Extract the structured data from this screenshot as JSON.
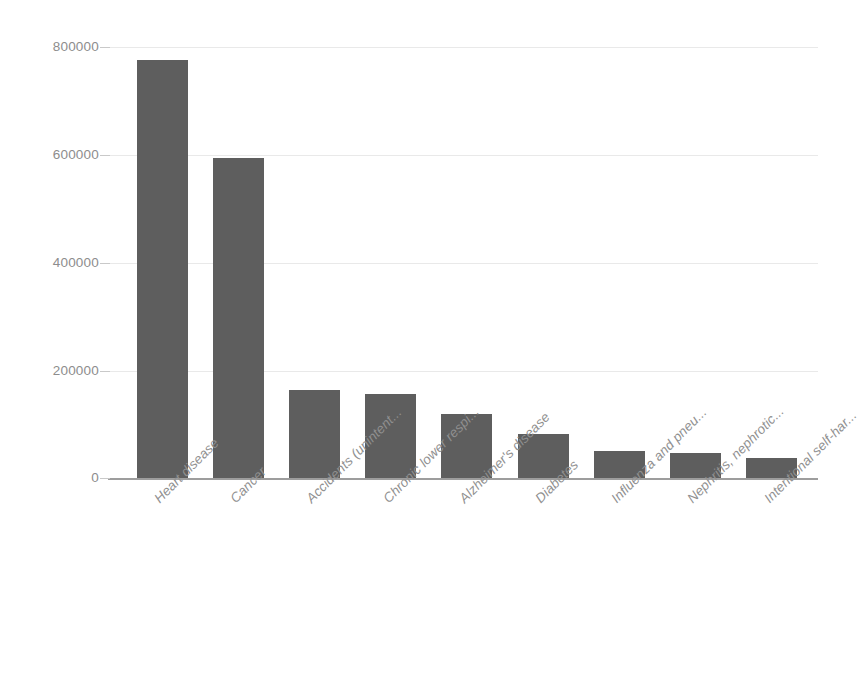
{
  "chart_data": {
    "type": "bar",
    "title": "",
    "subtitle": "",
    "xlabel": "",
    "ylabel": "",
    "ylim": [
      0,
      800000
    ],
    "grid": true,
    "legend": false,
    "legend_position": "none",
    "orientation": "vertical",
    "categories": [
      "Heart disease",
      "Cancer",
      "Accidents (unintent...",
      "Chronic lower respi...",
      "Alzheimer's disease",
      "Diabetes",
      "Influenza and pneu...",
      "Nephritis, nephrotic...",
      "Intentional self-har..."
    ],
    "values": [
      776000,
      594000,
      163000,
      155000,
      119000,
      81000,
      50000,
      46000,
      37000
    ],
    "y_ticks": [
      "0",
      "200000",
      "400000",
      "600000",
      "800000"
    ],
    "y_tick_values": [
      0,
      200000,
      400000,
      600000,
      800000
    ],
    "bar_color": "#5e5e5e",
    "gridline_color": "#e9e9e9",
    "axis_color": "#9d9d9d",
    "tick_label_color": "#8d8d8d",
    "category_label_color": "#909090",
    "background_color": "#ffffff"
  }
}
